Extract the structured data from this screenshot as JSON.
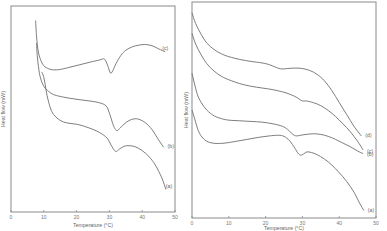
{
  "chart_data": [
    {
      "type": "line",
      "panel": "left",
      "title": "",
      "xlabel": "Temperature (°C)",
      "ylabel": "Heat flow (mW)",
      "xlim": [
        0,
        50
      ],
      "ylim": [
        0,
        100
      ],
      "xticks": [
        0,
        10,
        20,
        30,
        40,
        50
      ],
      "xtick_labels": [
        "0",
        "10",
        "20",
        "30",
        "40",
        "50"
      ],
      "yticks_shown": false,
      "grid": false,
      "legend": "inline-labels-right",
      "series": [
        {
          "name": "(c)",
          "x": [
            7.5,
            7.8,
            8.3,
            9,
            10,
            11.5,
            13,
            15,
            18,
            21,
            24,
            27,
            28.5,
            29.5,
            30.3,
            31,
            32,
            33.5,
            35,
            37,
            39,
            41,
            43,
            45,
            47
          ],
          "y": [
            93,
            85,
            78,
            74,
            71,
            69.5,
            69,
            69.2,
            70.3,
            71.5,
            72.7,
            73.8,
            74.2,
            71,
            67.5,
            68.5,
            72,
            76,
            78.5,
            80.2,
            81,
            81.3,
            80.7,
            79.2,
            77.8
          ]
        },
        {
          "name": "(b)",
          "x": [
            7.8,
            8,
            8.5,
            9,
            10,
            11.5,
            13,
            15,
            18,
            21,
            24,
            27,
            29,
            30,
            31,
            31.5,
            32.2,
            33,
            34.5,
            36,
            37.5,
            39,
            41,
            43,
            45,
            46.5
          ],
          "y": [
            82,
            76,
            69,
            65,
            61,
            58.5,
            57,
            56.1,
            55.2,
            54.5,
            53.9,
            53,
            51.5,
            48,
            43,
            41,
            39.5,
            40.3,
            42.7,
            44.4,
            45.2,
            45,
            43.3,
            40,
            35,
            31.5
          ]
        },
        {
          "name": "(a)",
          "x": [
            9.3,
            9.8,
            10.3,
            11,
            12,
            13,
            14.5,
            16,
            18,
            20,
            22,
            24,
            26,
            28,
            29.5,
            30.5,
            31.5,
            32.2,
            33,
            34.5,
            36,
            38,
            40,
            42,
            44,
            46,
            47.2
          ],
          "y": [
            68,
            66.5,
            63,
            56.5,
            50.5,
            47.3,
            45,
            43.7,
            43,
            42.6,
            41.8,
            40.7,
            39.4,
            37.6,
            35.5,
            32.5,
            30,
            29.4,
            30.5,
            31.9,
            32.2,
            31.6,
            29.8,
            27,
            22.8,
            16.5,
            11
          ]
        }
      ]
    },
    {
      "type": "line",
      "panel": "right",
      "title": "",
      "xlabel": "Temperature (°C)",
      "ylabel": "Heat flow (mW)",
      "xlim": [
        0,
        50
      ],
      "ylim": [
        0,
        100
      ],
      "xticks": [
        0,
        10,
        20,
        30,
        40,
        50
      ],
      "xtick_labels": [
        "0",
        "10",
        "20",
        "30",
        "40",
        "50"
      ],
      "yticks_shown": false,
      "grid": false,
      "legend": "inline-labels-right",
      "series": [
        {
          "name": "(d)",
          "x": [
            0,
            1,
            2.5,
            4,
            6,
            8,
            10,
            13,
            16,
            19,
            21,
            22.5,
            23.5,
            24.5,
            26,
            28,
            30,
            32,
            34,
            36,
            38,
            40,
            42,
            44,
            46
          ],
          "y": [
            95,
            90,
            85,
            81,
            78,
            76,
            74.7,
            73.4,
            72.5,
            71.8,
            71,
            70,
            69.3,
            69,
            69.2,
            69.4,
            69.2,
            68.3,
            66.5,
            63.5,
            59,
            53.5,
            48,
            42.5,
            38
          ]
        },
        {
          "name": "(c)",
          "x": [
            0,
            1,
            2.5,
            4,
            6,
            8,
            10,
            13,
            16,
            19,
            22,
            25,
            27,
            28.5,
            29.5,
            30.3,
            31,
            33,
            35,
            37,
            39,
            41,
            43,
            45,
            46.5
          ],
          "y": [
            85.5,
            80.5,
            75.5,
            71.5,
            68,
            65.6,
            64,
            62.2,
            61,
            60.2,
            59.4,
            58.2,
            57,
            55.8,
            54.6,
            54.1,
            54.2,
            53.4,
            52,
            49.8,
            47,
            43.6,
            40,
            35.5,
            31.5
          ]
        },
        {
          "name": "(b)",
          "x": [
            0,
            0.7,
            1.5,
            2.5,
            4,
            6,
            8,
            10,
            13,
            16,
            19,
            22,
            24.5,
            26,
            27,
            27.8,
            28.5,
            29.5,
            31,
            33,
            35,
            37,
            39,
            41,
            43,
            45,
            46.5
          ],
          "y": [
            67,
            62,
            57,
            53.5,
            50,
            47.3,
            46,
            45.3,
            45,
            44.7,
            44.4,
            43.6,
            42.5,
            41,
            39.3,
            38.3,
            38,
            38.3,
            38.7,
            39,
            38.7,
            37.8,
            36.4,
            34.7,
            33,
            31,
            29.8
          ]
        },
        {
          "name": "(a)",
          "x": [
            0,
            0.8,
            1.7,
            2.7,
            4,
            5.5,
            7,
            9,
            12,
            15,
            18,
            21,
            23.5,
            25,
            26.5,
            28,
            28.8,
            29.5,
            30.3,
            31.2,
            32.5,
            34,
            36,
            38,
            40,
            42,
            44,
            45.5,
            46.7
          ],
          "y": [
            50,
            45.5,
            40.5,
            37.5,
            35.5,
            34.7,
            34.5,
            34.7,
            35.5,
            36.4,
            37.3,
            38,
            38.3,
            37.8,
            35.8,
            32.2,
            30,
            29.1,
            29.6,
            30.6,
            30.3,
            29.3,
            27.3,
            24.5,
            21,
            17,
            12,
            7,
            3.5
          ]
        }
      ]
    }
  ]
}
